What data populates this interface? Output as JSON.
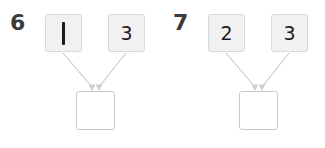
{
  "worksheet": {
    "background_color": "#ffffff",
    "box_fill_color": "#f1f1f1",
    "box_border_color": "#d9d9d9",
    "answer_box_fill_color": "#ffffff",
    "answer_box_border_color": "#c9c9c9",
    "arrow_color": "#bdbdbd",
    "number_color": "#1c1c1c",
    "label_color": "#3a3a3a"
  },
  "problems": [
    {
      "number_label": "6",
      "addend_left": "1",
      "addend_right": "3",
      "sum_value": "",
      "left_is_stroke_glyph": true,
      "arrow_left_name": "arrow-left-to-sum",
      "arrow_right_name": "arrow-right-to-sum"
    },
    {
      "number_label": "7",
      "addend_left": "2",
      "addend_right": "3",
      "sum_value": "",
      "left_is_stroke_glyph": false,
      "arrow_left_name": "arrow-left-to-sum",
      "arrow_right_name": "arrow-right-to-sum"
    }
  ]
}
